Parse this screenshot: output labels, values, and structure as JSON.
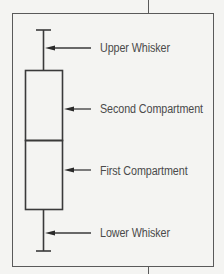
{
  "diagram": {
    "type": "box-plot-anatomy",
    "labels": {
      "upper_whisker": "Upper Whisker",
      "second_compartment": "Second Compartment",
      "first_compartment": "First Compartment",
      "lower_whisker": "Lower Whisker"
    },
    "colors": {
      "background": "#f4f4f2",
      "line": "#3a3a3a",
      "text": "#4a4a4a"
    }
  }
}
